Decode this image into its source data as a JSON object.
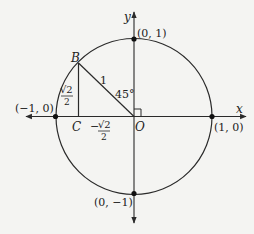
{
  "diagram": {
    "axes": {
      "x_label": "x",
      "y_label": "y"
    },
    "points": {
      "top": "(0, 1)",
      "bottom": "(0, −1)",
      "left": "(−1, 0)",
      "right": "(1, 0)",
      "B": "B",
      "C": "C",
      "O": "O"
    },
    "labels": {
      "hypotenuse": "1",
      "angle": "45°",
      "vertical_leg_num": "√2",
      "vertical_leg_den": "2",
      "horizontal_leg_sign": "−",
      "horizontal_leg_num": "√2",
      "horizontal_leg_den": "2"
    },
    "colors": {
      "stroke": "#2a2a2a",
      "background": "#f4f4f2"
    }
  }
}
